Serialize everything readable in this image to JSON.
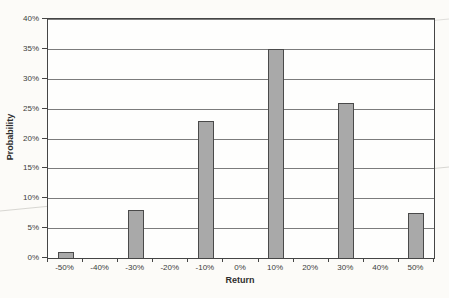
{
  "chart_data": {
    "type": "bar",
    "title": "",
    "xlabel": "Return",
    "ylabel": "Probability",
    "categories": [
      "-50%",
      "-40%",
      "-30%",
      "-20%",
      "-10%",
      "0%",
      "10%",
      "20%",
      "30%",
      "40%",
      "50%"
    ],
    "values": [
      1,
      0,
      8,
      0,
      23,
      0,
      35,
      0,
      26,
      0,
      7.5
    ],
    "ylim": [
      0,
      40
    ],
    "y_tick_step": 5,
    "y_tick_labels": [
      "0%",
      "5%",
      "10%",
      "15%",
      "20%",
      "25%",
      "30%",
      "35%",
      "40%"
    ],
    "grid": "horizontal",
    "legend": "none",
    "bar_fill_color": "#a9a9a9",
    "bar_border_color": "#4a4a4a",
    "gridline_color": "#7c7c7c",
    "axis_color": "#454545",
    "page_background_color": "#fcfbf8"
  }
}
